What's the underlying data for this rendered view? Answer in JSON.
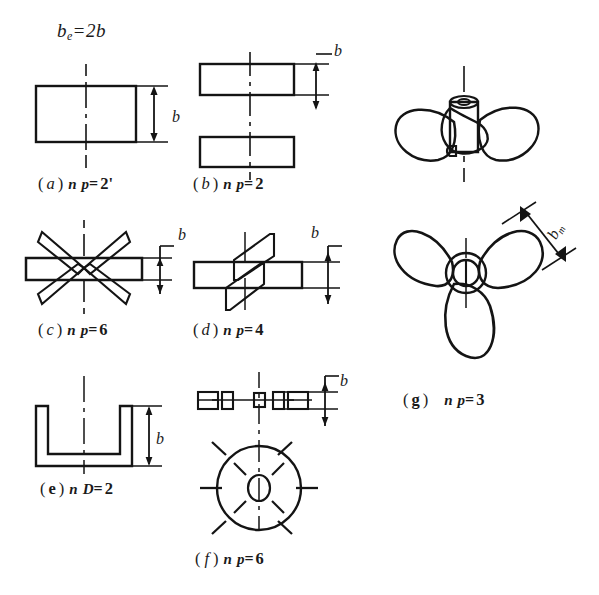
{
  "figure": {
    "kind": "engineering-line-drawing",
    "top_formula": {
      "symbol": "b",
      "subscript": "e",
      "equals": "=",
      "expression": "2b"
    },
    "panels": [
      {
        "id": "a",
        "label_open": "(",
        "label_letter": "a",
        "label_close": ")",
        "variable": "n",
        "subscript": "p",
        "equals": "=",
        "value": "2'",
        "dimension_label": "b",
        "shape": "single-flat-paddle-elevation"
      },
      {
        "id": "b",
        "label_open": "(",
        "label_letter": "b",
        "label_close": ")",
        "variable": "n",
        "subscript": "p",
        "equals": "=",
        "value": "2",
        "dimension_label": "b",
        "shape": "two-offset-flat-paddles"
      },
      {
        "id": "c",
        "label_open": "(",
        "label_letter": "c",
        "label_close": ")",
        "variable": "n",
        "subscript": "p",
        "equals": "=",
        "value": "6",
        "dimension_label": "b",
        "shape": "six-blade-star-paddle"
      },
      {
        "id": "d",
        "label_open": "(",
        "label_letter": "d",
        "label_close": ")",
        "variable": "n",
        "subscript": "p",
        "equals": "=",
        "value": "4",
        "dimension_label": "b",
        "shape": "four-blade-pitched-paddle"
      },
      {
        "id": "e",
        "label_open": "(",
        "label_letter": "e",
        "label_close": ")",
        "variable": "n",
        "subscript": "D",
        "equals": "=",
        "value": "2",
        "dimension_label": "b",
        "shape": "u-channel-anchor"
      },
      {
        "id": "f",
        "label_open": "(",
        "label_letter": "f",
        "label_close": ")",
        "variable": "n",
        "subscript": "p",
        "equals": "=",
        "value": "6",
        "dimension_label": "b",
        "shape": "disc-turbine-elevation-and-plan"
      },
      {
        "id": "g",
        "label_open": "(",
        "label_letter": "g",
        "label_close": ")",
        "variable": "n",
        "subscript": "p",
        "equals": "=",
        "value": "3",
        "dimension_label": "b",
        "dimension_subscript": "m",
        "shape": "three-blade-marine-propeller-two-views"
      }
    ]
  }
}
